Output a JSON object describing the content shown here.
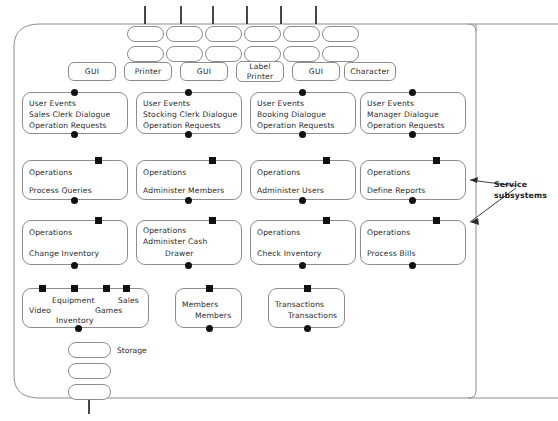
{
  "diagram": {
    "frame": {
      "stroke": "#8d8d8d"
    },
    "ink": "#111111",
    "text_color": "#2b2b2b"
  },
  "top_connectors": {
    "count": 6,
    "orientation": "vertical-tick"
  },
  "interface_pills_row1": [
    {
      "id": "iface-r1-1"
    },
    {
      "id": "iface-r1-2"
    },
    {
      "id": "iface-r1-3"
    },
    {
      "id": "iface-r1-4"
    },
    {
      "id": "iface-r1-5"
    },
    {
      "id": "iface-r1-6"
    }
  ],
  "interface_pills_row2": [
    {
      "id": "iface-r2-1"
    },
    {
      "id": "iface-r2-2"
    },
    {
      "id": "iface-r2-3"
    },
    {
      "id": "iface-r2-4"
    },
    {
      "id": "iface-r2-5"
    },
    {
      "id": "iface-r2-6"
    }
  ],
  "device_pills": [
    {
      "label": "GUI"
    },
    {
      "label": "Printer"
    },
    {
      "label": "GUI"
    },
    {
      "label": "Label\nPrinter"
    },
    {
      "label": "GUI"
    },
    {
      "label": "Character"
    }
  ],
  "dialogue_subsystems": [
    {
      "line1": "User Events",
      "line2": "Sales Clerk Dialogue",
      "line3": "Operation Requests"
    },
    {
      "line1": "User Events",
      "line2": "Stocking Clerk Dialogue",
      "line3": "Operation Requests"
    },
    {
      "line1": "User Events",
      "line2": "Booking Dialogue",
      "line3": "Operation Requests"
    },
    {
      "line1": "User Events",
      "line2": "Manager Dialogue",
      "line3": "Operation Requests"
    }
  ],
  "service_subsystems_row1": [
    {
      "line1": "Operations",
      "line2": "Process Queries"
    },
    {
      "line1": "Operations",
      "line2": "Administer Members"
    },
    {
      "line1": "Operations",
      "line2": "Administer Users"
    },
    {
      "line1": "Operations",
      "line2": "Define Reports"
    }
  ],
  "service_subsystems_row2": [
    {
      "line1": "Operations",
      "line2": "Change Inventory",
      "indent2": false
    },
    {
      "line1": "Operations",
      "line2": "Administer Cash",
      "line3": "Drawer",
      "indent2": true
    },
    {
      "line1": "Operations",
      "line2": "Check Inventory",
      "indent2": false
    },
    {
      "line1": "Operations",
      "line2": "Process Bills",
      "indent2": false
    }
  ],
  "entity_subsystems": [
    {
      "name": "inventory-entity",
      "words": [
        "Video",
        "Equipment",
        "Inventory",
        "Games",
        "Sales"
      ],
      "square_count": 4
    },
    {
      "name": "members-entity",
      "words": [
        "Members",
        "Members"
      ],
      "square_count": 1
    },
    {
      "name": "transactions-entity",
      "words": [
        "Transactions",
        "Transactions"
      ],
      "square_count": 1
    }
  ],
  "storage_stack": {
    "label": "Storage",
    "pill_count": 3
  },
  "annotations": [
    {
      "text": "Service\nsubsystems"
    }
  ]
}
